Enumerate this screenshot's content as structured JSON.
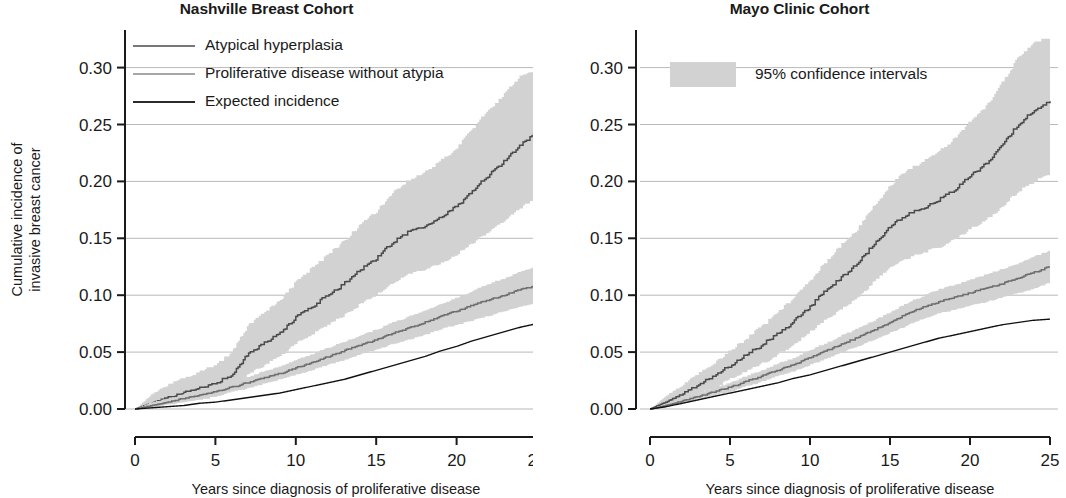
{
  "figure": {
    "background": "#ffffff",
    "ink": "#1a1a1a"
  },
  "colors": {
    "band": "#d2d2d2",
    "atypical": "#4a4a4a",
    "proliferative": "#6e6e6e",
    "expected": "#111111",
    "grid": "#b9b9b9",
    "axis": "#1a1a1a"
  },
  "panels": [
    {
      "id": "nashville",
      "title": "Nashville Breast Cohort",
      "x_axis_title": "Years since diagnosis of proliferative disease",
      "y_axis_title_line1": "Cumulative incidence of",
      "y_axis_title_line2": "invasive breast cancer",
      "y_ticks": [
        "0.00",
        "0.05",
        "0.10",
        "0.15",
        "0.20",
        "0.25",
        "0.30"
      ],
      "x_ticks": [
        "0",
        "5",
        "10",
        "15",
        "20",
        "25"
      ],
      "legend": [
        {
          "label": "Atypical hyperplasia",
          "style": "solid-medium",
          "color": "#4a4a4a"
        },
        {
          "label": "Proliferative disease without atypia",
          "style": "solid-light",
          "color": "#8a8a8a"
        },
        {
          "label": "Expected incidence",
          "style": "solid-dark",
          "color": "#2b2b2b"
        }
      ]
    },
    {
      "id": "mayo",
      "title": "Mayo Clinic Cohort",
      "x_axis_title": "Years since diagnosis of proliferative disease",
      "y_axis_title_line1": "",
      "y_axis_title_line2": "",
      "y_ticks": [
        "0.00",
        "0.05",
        "0.10",
        "0.15",
        "0.20",
        "0.25",
        "0.30"
      ],
      "x_ticks": [
        "0",
        "5",
        "10",
        "15",
        "20",
        "25"
      ],
      "legend": [
        {
          "label": "95% confidence intervals",
          "style": "band-swatch",
          "color": "#d2d2d2"
        }
      ]
    }
  ],
  "chart_data": {
    "type": "line",
    "xlabel": "Years since diagnosis of proliferative disease",
    "ylabel": "Cumulative incidence of invasive breast cancer",
    "xlim": [
      0,
      25
    ],
    "ylim": [
      0.0,
      0.325
    ],
    "yticks": [
      0.0,
      0.05,
      0.1,
      0.15,
      0.2,
      0.25,
      0.3
    ],
    "xticks": [
      0,
      5,
      10,
      15,
      20,
      25
    ],
    "grid": "horizontal",
    "legend_position": "upper-left",
    "panels": [
      {
        "name": "Nashville Breast Cohort",
        "series": [
          {
            "name": "Atypical hyperplasia",
            "x": [
              0,
              1,
              2,
              3,
              4,
              5,
              6,
              7,
              8,
              9,
              10,
              11,
              12,
              13,
              14,
              15,
              16,
              17,
              18,
              19,
              20,
              21,
              22,
              23,
              24,
              25
            ],
            "values": [
              0.0,
              0.005,
              0.01,
              0.014,
              0.018,
              0.022,
              0.03,
              0.048,
              0.057,
              0.066,
              0.08,
              0.09,
              0.1,
              0.11,
              0.122,
              0.132,
              0.146,
              0.155,
              0.16,
              0.168,
              0.178,
              0.192,
              0.205,
              0.218,
              0.232,
              0.244
            ],
            "ci_lower": [
              0.0,
              0.001,
              0.004,
              0.006,
              0.008,
              0.011,
              0.016,
              0.03,
              0.038,
              0.046,
              0.058,
              0.066,
              0.074,
              0.082,
              0.092,
              0.1,
              0.111,
              0.118,
              0.122,
              0.128,
              0.136,
              0.146,
              0.156,
              0.166,
              0.177,
              0.186
            ],
            "ci_upper": [
              0.0,
              0.013,
              0.021,
              0.027,
              0.033,
              0.038,
              0.05,
              0.073,
              0.084,
              0.095,
              0.112,
              0.124,
              0.136,
              0.148,
              0.162,
              0.174,
              0.19,
              0.201,
              0.208,
              0.218,
              0.23,
              0.247,
              0.263,
              0.278,
              0.293,
              0.299
            ]
          },
          {
            "name": "Proliferative disease without atypia",
            "x": [
              0,
              1,
              2,
              3,
              4,
              5,
              6,
              7,
              8,
              9,
              10,
              11,
              12,
              13,
              14,
              15,
              16,
              17,
              18,
              19,
              20,
              21,
              22,
              23,
              24,
              25
            ],
            "values": [
              0.0,
              0.003,
              0.006,
              0.009,
              0.012,
              0.015,
              0.019,
              0.023,
              0.027,
              0.031,
              0.036,
              0.041,
              0.046,
              0.051,
              0.056,
              0.061,
              0.066,
              0.071,
              0.076,
              0.081,
              0.086,
              0.091,
              0.096,
              0.1,
              0.105,
              0.109
            ],
            "ci_lower": [
              0.0,
              0.001,
              0.004,
              0.006,
              0.009,
              0.011,
              0.015,
              0.018,
              0.022,
              0.026,
              0.03,
              0.034,
              0.039,
              0.043,
              0.048,
              0.052,
              0.057,
              0.061,
              0.065,
              0.07,
              0.074,
              0.078,
              0.082,
              0.086,
              0.09,
              0.094
            ],
            "ci_upper": [
              0.0,
              0.006,
              0.009,
              0.013,
              0.016,
              0.019,
              0.023,
              0.028,
              0.033,
              0.037,
              0.043,
              0.048,
              0.054,
              0.059,
              0.065,
              0.07,
              0.076,
              0.081,
              0.087,
              0.092,
              0.098,
              0.104,
              0.11,
              0.115,
              0.121,
              0.125
            ]
          },
          {
            "name": "Expected incidence",
            "x": [
              0,
              1,
              2,
              3,
              4,
              5,
              6,
              7,
              8,
              9,
              10,
              11,
              12,
              13,
              14,
              15,
              16,
              17,
              18,
              19,
              20,
              21,
              22,
              23,
              24,
              25
            ],
            "values": [
              0.0,
              0.001,
              0.002,
              0.003,
              0.005,
              0.006,
              0.008,
              0.01,
              0.012,
              0.014,
              0.017,
              0.02,
              0.023,
              0.026,
              0.03,
              0.034,
              0.038,
              0.042,
              0.046,
              0.051,
              0.055,
              0.06,
              0.064,
              0.068,
              0.072,
              0.075
            ]
          }
        ]
      },
      {
        "name": "Mayo Clinic Cohort",
        "series": [
          {
            "name": "Atypical hyperplasia",
            "x": [
              0,
              1,
              2,
              3,
              4,
              5,
              6,
              7,
              8,
              9,
              10,
              11,
              12,
              13,
              14,
              15,
              16,
              17,
              18,
              19,
              20,
              21,
              22,
              23,
              24,
              25
            ],
            "values": [
              0.0,
              0.006,
              0.013,
              0.021,
              0.029,
              0.038,
              0.047,
              0.056,
              0.066,
              0.077,
              0.09,
              0.104,
              0.116,
              0.128,
              0.145,
              0.16,
              0.17,
              0.176,
              0.183,
              0.192,
              0.205,
              0.215,
              0.232,
              0.25,
              0.262,
              0.27
            ],
            "ci_lower": [
              0.0,
              0.002,
              0.007,
              0.013,
              0.019,
              0.026,
              0.033,
              0.04,
              0.048,
              0.057,
              0.068,
              0.079,
              0.089,
              0.098,
              0.112,
              0.124,
              0.132,
              0.137,
              0.142,
              0.149,
              0.158,
              0.166,
              0.178,
              0.191,
              0.2,
              0.206
            ],
            "ci_upper": [
              0.0,
              0.012,
              0.021,
              0.031,
              0.041,
              0.051,
              0.062,
              0.073,
              0.085,
              0.098,
              0.113,
              0.13,
              0.145,
              0.159,
              0.179,
              0.197,
              0.209,
              0.217,
              0.226,
              0.237,
              0.253,
              0.266,
              0.287,
              0.309,
              0.323,
              0.325
            ]
          },
          {
            "name": "Proliferative disease without atypia",
            "x": [
              0,
              1,
              2,
              3,
              4,
              5,
              6,
              7,
              8,
              9,
              10,
              11,
              12,
              13,
              14,
              15,
              16,
              17,
              18,
              19,
              20,
              21,
              22,
              23,
              24,
              25
            ],
            "values": [
              0.0,
              0.003,
              0.007,
              0.011,
              0.015,
              0.019,
              0.024,
              0.029,
              0.034,
              0.039,
              0.045,
              0.051,
              0.057,
              0.063,
              0.069,
              0.076,
              0.083,
              0.089,
              0.094,
              0.098,
              0.102,
              0.106,
              0.11,
              0.115,
              0.12,
              0.125
            ],
            "ci_lower": [
              0.0,
              0.002,
              0.005,
              0.008,
              0.012,
              0.015,
              0.02,
              0.024,
              0.029,
              0.033,
              0.039,
              0.044,
              0.05,
              0.055,
              0.061,
              0.067,
              0.073,
              0.079,
              0.084,
              0.087,
              0.091,
              0.094,
              0.098,
              0.102,
              0.106,
              0.111
            ],
            "ci_upper": [
              0.0,
              0.005,
              0.009,
              0.014,
              0.019,
              0.023,
              0.029,
              0.034,
              0.04,
              0.045,
              0.052,
              0.058,
              0.065,
              0.071,
              0.078,
              0.085,
              0.093,
              0.099,
              0.105,
              0.109,
              0.114,
              0.118,
              0.123,
              0.128,
              0.134,
              0.139
            ]
          },
          {
            "name": "Expected incidence",
            "x": [
              0,
              1,
              2,
              3,
              4,
              5,
              6,
              7,
              8,
              9,
              10,
              11,
              12,
              13,
              14,
              15,
              16,
              17,
              18,
              19,
              20,
              21,
              22,
              23,
              24,
              25
            ],
            "values": [
              0.0,
              0.002,
              0.005,
              0.008,
              0.011,
              0.014,
              0.017,
              0.02,
              0.023,
              0.027,
              0.03,
              0.034,
              0.038,
              0.042,
              0.046,
              0.05,
              0.054,
              0.058,
              0.062,
              0.065,
              0.068,
              0.071,
              0.074,
              0.076,
              0.078,
              0.079
            ]
          }
        ]
      }
    ]
  }
}
